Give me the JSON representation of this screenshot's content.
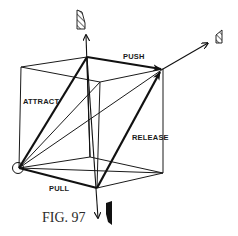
{
  "figure": {
    "caption": "Fig. 97",
    "caption_display": "FIG. 97",
    "labels": {
      "push": "PUSH",
      "attract": "ATTRACT",
      "release": "RELEASE",
      "pull": "PULL"
    },
    "colors": {
      "ink": "#111111",
      "background": "#ffffff"
    }
  }
}
